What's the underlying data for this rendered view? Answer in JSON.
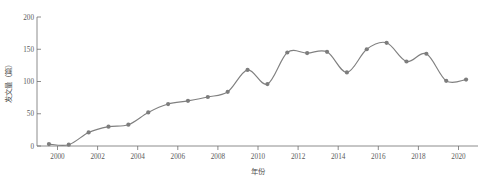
{
  "chart_data": {
    "type": "line",
    "title": "",
    "subtitle": "",
    "xlabel": "年份",
    "ylabel": "发文量（篇）",
    "xlim": [
      1999.4,
      2021.6
    ],
    "ylim": [
      0,
      200
    ],
    "yticks": [
      0,
      50,
      100,
      150,
      200
    ],
    "ytick_labels": [
      "0",
      "50",
      "100",
      "150",
      "200"
    ],
    "xticks": [
      2000,
      2002,
      2004,
      2006,
      2008,
      2010,
      2012,
      2014,
      2016,
      2018,
      2020
    ],
    "xtick_labels": [
      "2000",
      "2002",
      "2004",
      "2006",
      "2008",
      "2010",
      "2012",
      "2014",
      "2016",
      "2018",
      "2020"
    ],
    "grid": false,
    "legend": null,
    "x": [
      2000,
      2001,
      2002,
      2003,
      2004,
      2005,
      2006,
      2007,
      2008,
      2009,
      2010,
      2011,
      2012,
      2013,
      2014,
      2015,
      2016,
      2017,
      2018,
      2019,
      2020,
      2021
    ],
    "values": [
      3,
      2,
      21,
      30,
      33,
      52,
      65,
      70,
      76,
      84,
      118,
      96,
      145,
      144,
      146,
      114,
      150,
      160,
      131,
      143,
      101,
      103
    ],
    "series": [
      {
        "name": "发文量",
        "values": [
          3,
          2,
          21,
          30,
          33,
          52,
          65,
          70,
          76,
          84,
          118,
          96,
          145,
          144,
          146,
          114,
          150,
          160,
          131,
          143,
          101,
          103
        ],
        "line_color": "#808080",
        "marker_color": "#7d7d7d",
        "marker": "circle",
        "smoothed": true
      }
    ],
    "annotations": []
  },
  "figure": {
    "caption": "",
    "background_color": "#ffffff",
    "axis_color": "#6e6e6e",
    "text_color": "#4f4f4f"
  }
}
